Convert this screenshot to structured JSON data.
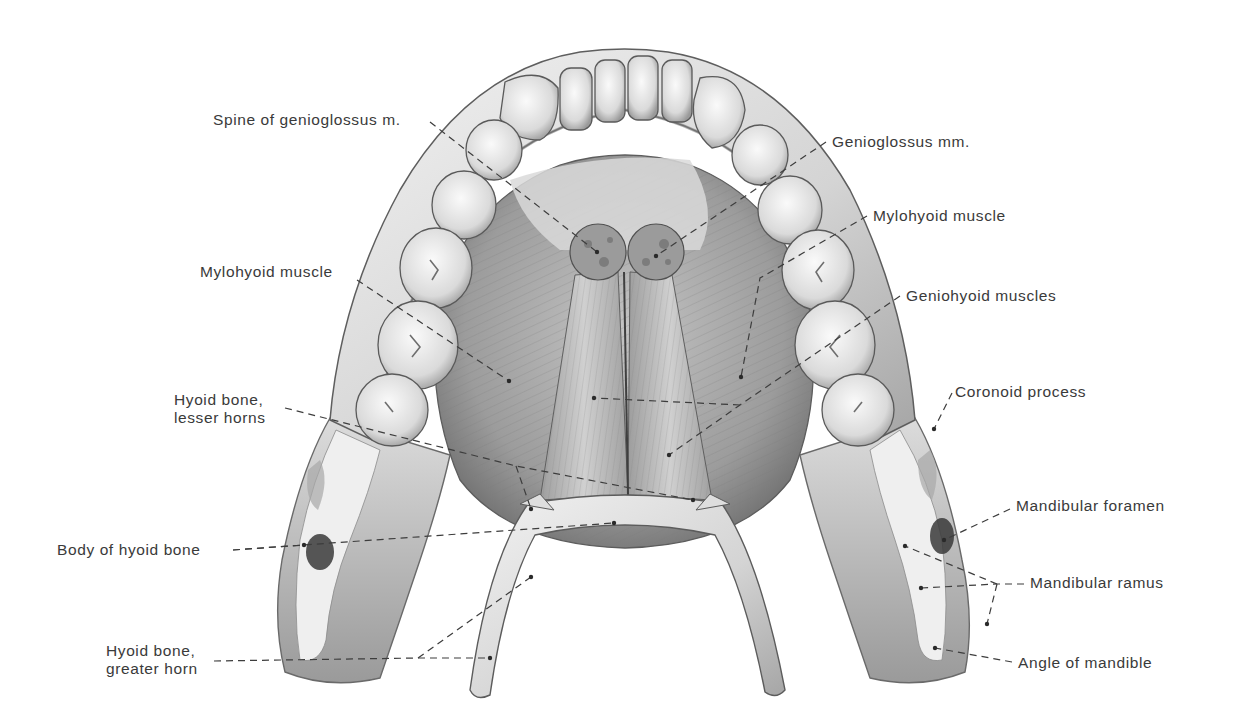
{
  "figure": {
    "colors": {
      "background": "#ffffff",
      "label_text": "#3a3a3a",
      "leader_line": "#3d3d3d",
      "bone_light": "#ececec",
      "bone_mid": "#c9c9c9",
      "bone_dark": "#8a8a8a",
      "muscle_light": "#b8b8b8",
      "muscle_dark": "#6e6e6e",
      "foramen": "#2e2e2e"
    }
  },
  "labels": [
    {
      "id": "spine-genioglossus",
      "text": "Spine of genioglossus m.",
      "x": 213,
      "y": 111,
      "align": "left",
      "line": [
        [
          430,
          122
        ],
        [
          597,
          252
        ]
      ]
    },
    {
      "id": "genioglossus-mm",
      "text": "Genioglossus mm.",
      "x": 832,
      "y": 133,
      "align": "left",
      "line": [
        [
          826,
          142
        ],
        [
          656,
          256
        ]
      ]
    },
    {
      "id": "mylohyoid-muscle-right",
      "text": "Mylohyoid muscle",
      "x": 873,
      "y": 207,
      "align": "left",
      "line": [
        [
          867,
          216
        ],
        [
          760,
          278
        ],
        [
          741,
          377
        ]
      ]
    },
    {
      "id": "mylohyoid-muscle-left",
      "text": "Mylohyoid muscle",
      "x": 200,
      "y": 263,
      "align": "left",
      "line": [
        [
          357,
          280
        ],
        [
          509,
          381
        ]
      ]
    },
    {
      "id": "geniohyoid-muscles",
      "text": "Geniohyoid muscles",
      "x": 906,
      "y": 287,
      "align": "left",
      "line": [
        [
          900,
          296
        ],
        [
          740,
          405
        ],
        [
          669,
          455
        ]
      ]
    },
    {
      "id": "coronoid-process",
      "text": "Coronoid process",
      "x": 955,
      "y": 383,
      "align": "left",
      "line": [
        [
          952,
          393
        ],
        [
          934,
          429
        ]
      ]
    },
    {
      "id": "hyoid-lesser-horns",
      "text": "Hyoid bone,\nlesser horns",
      "x": 174,
      "y": 391,
      "align": "left",
      "line": [
        [
          285,
          408
        ],
        [
          516,
          466
        ],
        [
          693,
          500
        ]
      ]
    },
    {
      "id": "mandibular-foramen",
      "text": "Mandibular foramen",
      "x": 1016,
      "y": 497,
      "align": "left",
      "line": [
        [
          1010,
          509
        ],
        [
          944,
          540
        ]
      ]
    },
    {
      "id": "body-hyoid",
      "text": "Body of hyoid bone",
      "x": 57,
      "y": 541,
      "align": "left",
      "line": [
        [
          233,
          550
        ],
        [
          614,
          523
        ]
      ]
    },
    {
      "id": "mandibular-ramus",
      "text": "Mandibular ramus",
      "x": 1030,
      "y": 574,
      "align": "left",
      "line": [
        [
          1024,
          584
        ],
        [
          997,
          584
        ],
        [
          921,
          588
        ]
      ]
    },
    {
      "id": "hyoid-greater-horn",
      "text": "Hyoid bone,\ngreater horn",
      "x": 106,
      "y": 642,
      "align": "left",
      "line": [
        [
          214,
          661
        ],
        [
          418,
          658
        ],
        [
          490,
          658
        ]
      ]
    },
    {
      "id": "angle-of-mandible",
      "text": "Angle of mandible",
      "x": 1018,
      "y": 654,
      "align": "left",
      "line": [
        [
          1012,
          662
        ],
        [
          935,
          648
        ]
      ]
    }
  ],
  "extra_leaders": [
    {
      "for": "hyoid-greater-horn",
      "line": [
        [
          418,
          658
        ],
        [
          531,
          577
        ]
      ]
    },
    {
      "for": "geniohyoid-muscles",
      "line": [
        [
          740,
          405
        ],
        [
          594,
          398
        ]
      ]
    },
    {
      "for": "mandibular-ramus",
      "line": [
        [
          997,
          584
        ],
        [
          905,
          546
        ]
      ]
    },
    {
      "for": "mandibular-ramus",
      "line": [
        [
          997,
          584
        ],
        [
          987,
          624
        ]
      ]
    },
    {
      "for": "hyoid-lesser-horns",
      "line": [
        [
          516,
          466
        ],
        [
          531,
          509
        ]
      ]
    },
    {
      "for": "body-hyoid",
      "line": [
        [
          233,
          550
        ],
        [
          304,
          545
        ]
      ]
    }
  ]
}
